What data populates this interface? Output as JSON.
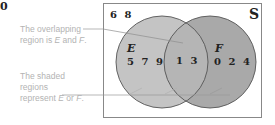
{
  "corner_label": "0",
  "annotations": {
    "overlap": {
      "line1": "The overlapping",
      "line2_prefix": "region is ",
      "set_e": "E",
      "and": " and ",
      "set_f": "F",
      "period": "."
    },
    "shaded": {
      "line1": "The shaded",
      "line2": "regions",
      "line3_prefix": "represent ",
      "set_e": "E",
      "or": " or ",
      "set_f": "F",
      "period": "."
    }
  },
  "venn": {
    "universe_label": "S",
    "outside_elements": "6 8",
    "set_e": {
      "label": "E",
      "only_elements": "5 7 9"
    },
    "set_f": {
      "label": "F",
      "only_elements": "0 2 4"
    },
    "intersection_elements": "1 3",
    "colors": {
      "circle_e_fill": "#c4c4c4",
      "circle_f_fill": "#a9a9a9",
      "overlap_fill": "#b5b5b5",
      "outline": "#555555",
      "box": "#888888",
      "label_text": "#b3b3b3"
    }
  }
}
